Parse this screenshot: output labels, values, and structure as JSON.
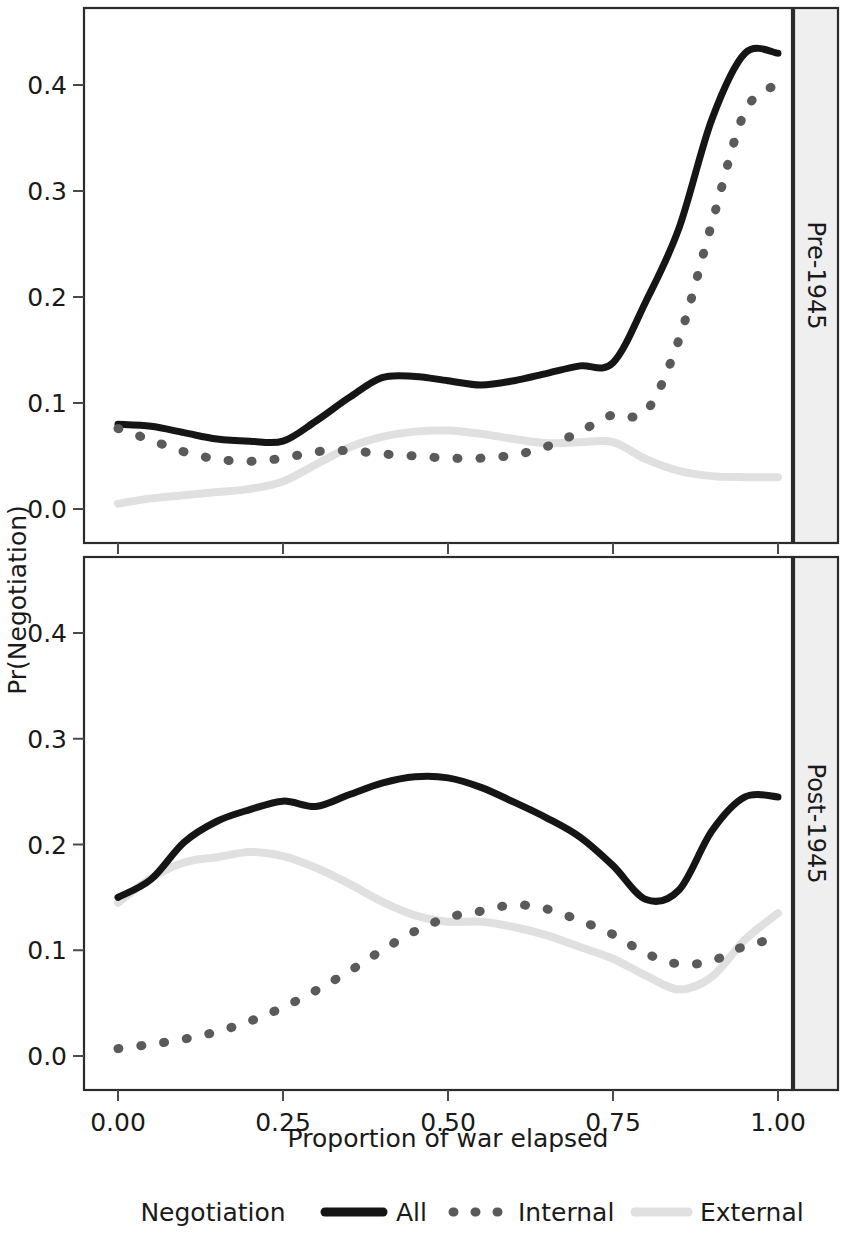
{
  "figure": {
    "ylabel": "Pr(Negotiation)",
    "xlabel": "Proportion of war elapsed",
    "strip_top": "Pre-1945",
    "strip_bottom": "Post-1945"
  },
  "legend": {
    "title": "Negotiation",
    "entries": [
      {
        "label": "All",
        "style": "solid",
        "color": "#151515"
      },
      {
        "label": "Internal",
        "style": "dotted",
        "color": "#5a5a5a"
      },
      {
        "label": "External",
        "style": "solid-light",
        "color": "#e0e0e0"
      }
    ]
  },
  "axes": {
    "x_ticks": [
      "0.00",
      "0.25",
      "0.50",
      "0.75",
      "1.00"
    ],
    "y_ticks": [
      "0.0",
      "0.1",
      "0.2",
      "0.3",
      "0.4"
    ]
  },
  "chart_data": [
    {
      "type": "line",
      "title": "Pre-1945",
      "xlabel": "Proportion of war elapsed",
      "ylabel": "Pr(Negotiation)",
      "xlim": [
        0.0,
        1.0
      ],
      "ylim": [
        -0.02,
        0.47
      ],
      "xticks": [
        0.0,
        0.25,
        0.5,
        0.75,
        1.0
      ],
      "yticks": [
        0.0,
        0.1,
        0.2,
        0.3,
        0.4
      ],
      "grid": false,
      "legend_position": "bottom",
      "x": [
        0.0,
        0.05,
        0.1,
        0.15,
        0.2,
        0.25,
        0.3,
        0.35,
        0.4,
        0.45,
        0.5,
        0.55,
        0.6,
        0.65,
        0.7,
        0.75,
        0.8,
        0.85,
        0.9,
        0.95,
        1.0
      ],
      "series": [
        {
          "name": "All",
          "values": [
            0.08,
            0.078,
            0.072,
            0.066,
            0.064,
            0.064,
            0.083,
            0.105,
            0.124,
            0.125,
            0.121,
            0.117,
            0.121,
            0.128,
            0.135,
            0.138,
            0.196,
            0.265,
            0.368,
            0.43,
            0.43
          ]
        },
        {
          "name": "Internal",
          "values": [
            0.076,
            0.065,
            0.054,
            0.047,
            0.045,
            0.048,
            0.054,
            0.055,
            0.052,
            0.05,
            0.048,
            0.048,
            0.051,
            0.059,
            0.073,
            0.089,
            0.092,
            0.16,
            0.27,
            0.375,
            0.401
          ]
        },
        {
          "name": "External",
          "values": [
            0.005,
            0.01,
            0.013,
            0.016,
            0.019,
            0.026,
            0.042,
            0.058,
            0.068,
            0.073,
            0.074,
            0.071,
            0.066,
            0.062,
            0.063,
            0.063,
            0.047,
            0.036,
            0.031,
            0.03,
            0.03
          ]
        }
      ]
    },
    {
      "type": "line",
      "title": "Post-1945",
      "xlabel": "Proportion of war elapsed",
      "ylabel": "Pr(Negotiation)",
      "xlim": [
        0.0,
        1.0
      ],
      "ylim": [
        -0.02,
        0.47
      ],
      "xticks": [
        0.0,
        0.25,
        0.5,
        0.75,
        1.0
      ],
      "yticks": [
        0.0,
        0.1,
        0.2,
        0.3,
        0.4
      ],
      "grid": false,
      "legend_position": "bottom",
      "x": [
        0.0,
        0.05,
        0.1,
        0.15,
        0.2,
        0.25,
        0.3,
        0.35,
        0.4,
        0.45,
        0.5,
        0.55,
        0.6,
        0.65,
        0.7,
        0.75,
        0.8,
        0.85,
        0.9,
        0.95,
        1.0
      ],
      "series": [
        {
          "name": "All",
          "values": [
            0.15,
            0.167,
            0.202,
            0.222,
            0.233,
            0.241,
            0.236,
            0.247,
            0.258,
            0.264,
            0.263,
            0.254,
            0.24,
            0.225,
            0.207,
            0.18,
            0.148,
            0.157,
            0.213,
            0.245,
            0.245
          ]
        },
        {
          "name": "Internal",
          "values": [
            0.007,
            0.011,
            0.016,
            0.023,
            0.033,
            0.046,
            0.062,
            0.08,
            0.1,
            0.118,
            0.131,
            0.137,
            0.143,
            0.139,
            0.128,
            0.115,
            0.097,
            0.087,
            0.09,
            0.104,
            0.111
          ]
        },
        {
          "name": "External",
          "values": [
            0.145,
            0.168,
            0.183,
            0.188,
            0.193,
            0.189,
            0.178,
            0.163,
            0.146,
            0.133,
            0.127,
            0.127,
            0.122,
            0.114,
            0.103,
            0.092,
            0.076,
            0.063,
            0.075,
            0.11,
            0.135
          ]
        }
      ]
    }
  ]
}
